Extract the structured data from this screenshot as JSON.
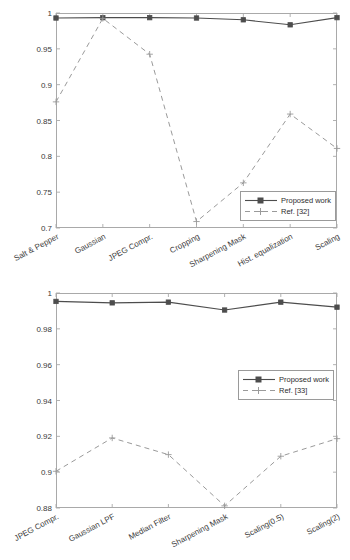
{
  "figure": {
    "background": "#ffffff",
    "axis_color": "#a9a9a9",
    "series_colors": {
      "proposed": "#4d4d4d",
      "reference": "#9a9a9a"
    }
  },
  "chart_data": [
    {
      "id": "top",
      "type": "line",
      "title": "",
      "xlabel": "",
      "ylabel": "",
      "ylim": [
        0.7,
        1.0
      ],
      "yticks": [
        0.7,
        0.75,
        0.8,
        0.85,
        0.9,
        0.95,
        1
      ],
      "ytick_labels": [
        "0.7",
        "0.75",
        "0.8",
        "0.85",
        "0.9",
        "0.95",
        "1"
      ],
      "grid": false,
      "legend_position": "lower right",
      "categories": [
        "Salt & Pepper",
        "Gaussian",
        "JPEG Compr.",
        "Cropping",
        "Sharpening Mask",
        "Hist. equalization",
        "Scaling"
      ],
      "series": [
        {
          "name": "Proposed work",
          "style": "solid",
          "marker": "square",
          "values": [
            0.993,
            0.9935,
            0.9935,
            0.993,
            0.9905,
            0.9835,
            0.9935
          ]
        },
        {
          "name": "Ref. [32]",
          "style": "dashed",
          "marker": "plus",
          "values": [
            0.876,
            0.9925,
            0.9425,
            0.709,
            0.763,
            0.859,
            0.811
          ]
        }
      ]
    },
    {
      "id": "bottom",
      "type": "line",
      "title": "",
      "xlabel": "",
      "ylabel": "",
      "ylim": [
        0.88,
        1.0
      ],
      "yticks": [
        0.88,
        0.9,
        0.92,
        0.94,
        0.96,
        0.98,
        1
      ],
      "ytick_labels": [
        "0.88",
        "0.9",
        "0.92",
        "0.94",
        "0.96",
        "0.98",
        "1"
      ],
      "grid": false,
      "legend_position": "center right",
      "categories": [
        "JPEG Compr.",
        "Gaussian LPF",
        "Median Filter",
        "Sharpening Mask",
        "Scaling(0.5)",
        "Scaling(2)"
      ],
      "series": [
        {
          "name": "Proposed work",
          "style": "solid",
          "marker": "square",
          "values": [
            0.9953,
            0.9945,
            0.9949,
            0.9905,
            0.9949,
            0.9921
          ]
        },
        {
          "name": "Ref. [33]",
          "style": "dashed",
          "marker": "plus",
          "values": [
            0.9005,
            0.9191,
            0.9098,
            0.8812,
            0.9089,
            0.9187
          ]
        }
      ]
    }
  ]
}
